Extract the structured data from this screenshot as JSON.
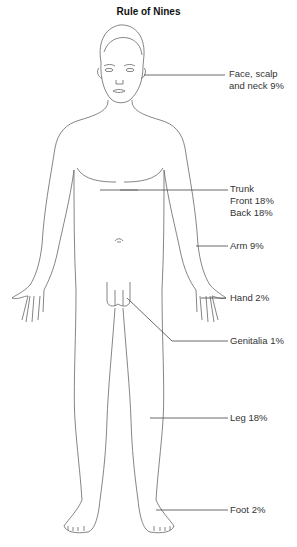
{
  "title": "Rule of Nines",
  "labels": {
    "face": [
      "Face, scalp",
      "and neck 9%"
    ],
    "trunk": [
      "Trunk",
      "Front 18%",
      "Back 18%"
    ],
    "arm": "Arm 9%",
    "hand": "Hand 2%",
    "genitalia": "Genitalia 1%",
    "leg": "Leg 18%",
    "foot": "Foot 2%"
  },
  "colors": {
    "outline": "#555555",
    "leader": "#444444",
    "text": "#333333"
  }
}
